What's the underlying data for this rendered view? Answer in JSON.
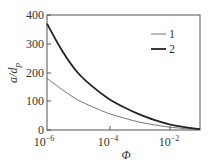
{
  "chart_data": {
    "type": "line",
    "title": "",
    "xlabel": "Φ",
    "ylabel": "a/d_p",
    "xscale": "log",
    "xlim": [
      1e-06,
      0.1
    ],
    "ylim": [
      0,
      400
    ],
    "x_ticks": [
      "10^-6",
      "10^-4",
      "10^-2"
    ],
    "y_ticks": [
      0,
      100,
      200,
      300,
      400
    ],
    "grid": false,
    "legend_position": "upper right",
    "x": [
      1e-06,
      3.16e-06,
      1e-05,
      3.16e-05,
      0.0001,
      0.000316,
      0.001,
      0.00316,
      0.01,
      0.0316,
      0.1
    ],
    "series": [
      {
        "name": "1",
        "style": "thin",
        "values": [
          180,
          140,
          105,
          80,
          58,
          42,
          28,
          18,
          10,
          5,
          2
        ]
      },
      {
        "name": "2",
        "style": "thick",
        "values": [
          370,
          275,
          200,
          150,
          110,
          80,
          55,
          35,
          20,
          10,
          3
        ]
      }
    ]
  },
  "axes": {
    "y_tick_labels": [
      "0",
      "100",
      "200",
      "300",
      "400"
    ],
    "x_tick_labels": [
      {
        "base": "10",
        "exp": "−6"
      },
      {
        "base": "10",
        "exp": "−4"
      },
      {
        "base": "10",
        "exp": "−2"
      }
    ],
    "xlabel": "Φ",
    "ylabel_main": "a/d",
    "ylabel_sub": "p"
  },
  "legend": {
    "items": [
      {
        "label": "1"
      },
      {
        "label": "2"
      }
    ]
  },
  "colors": {
    "axis": "#555555",
    "series1": "#555555",
    "series2": "#222222"
  }
}
